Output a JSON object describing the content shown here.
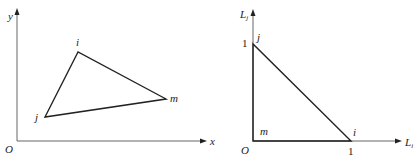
{
  "figures": [
    {
      "name": "cartesian-triangle",
      "axes": {
        "origin_label": "O",
        "x_label": "x",
        "y_label": "y"
      },
      "vertices": [
        {
          "label": "i",
          "x": 78,
          "y": 52
        },
        {
          "label": "j",
          "x": 45,
          "y": 117
        },
        {
          "label": "m",
          "x": 166,
          "y": 99
        }
      ]
    },
    {
      "name": "natural-coordinate-triangle",
      "axes": {
        "origin_label": "O",
        "x_label_base": "L",
        "x_label_sub": "i",
        "y_label_base": "L",
        "y_label_sub": "j",
        "x_tick_label": "1",
        "y_tick_label": "1"
      },
      "vertices": [
        {
          "label": "j",
          "coords": "(0,1)"
        },
        {
          "label": "i",
          "coords": "(1,0)"
        },
        {
          "label": "m",
          "coords": "(0,0)"
        }
      ]
    }
  ]
}
